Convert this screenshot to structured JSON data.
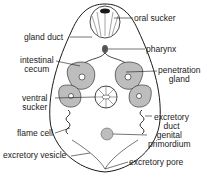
{
  "diagram": {
    "colors": {
      "ink": "#1a1a1a",
      "fill": "#bdbdbd",
      "background": "#ffffff"
    },
    "labels": {
      "oral_sucker": "oral sucker",
      "gland_duct": "gland duct",
      "pharynx": "pharynx",
      "intestinal_cecum_1": "intestinal",
      "intestinal_cecum_2": "cecum",
      "penetration_gland_1": "penetration",
      "penetration_gland_2": "gland",
      "ventral_sucker_1": "ventral",
      "ventral_sucker_2": "sucker",
      "excretory_duct_1": "excretory",
      "excretory_duct_2": "duct",
      "flame_cell": "flame cell",
      "genital_primordium_1": "genital",
      "genital_primordium_2": "primordium",
      "excretory_vesicle": "excretory vesicle",
      "excretory_pore": "excretory pore"
    }
  }
}
